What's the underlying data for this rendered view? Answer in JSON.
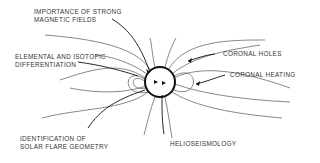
{
  "diagram": {
    "labels": {
      "magnetic": [
        "IMPORTANCE OF STRONG",
        "MAGNETIC FIELDS"
      ],
      "elemental": [
        "ELEMENTAL AND ISOTOPIC",
        "DIFFERENTIATION"
      ],
      "coronal_holes": "CORONAL HOLES",
      "coronal_heating": "CORONAL HEATING",
      "flare": [
        "IDENTIFICATION OF",
        "SOLAR FLARE GEOMETRY"
      ],
      "helioseismology": "HELIOSEISMOLOGY"
    }
  }
}
